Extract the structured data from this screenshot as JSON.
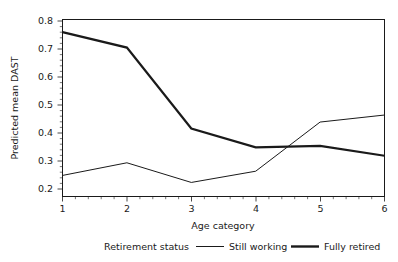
{
  "chart_data": {
    "type": "line",
    "title": "",
    "xlabel": "Age category",
    "ylabel": "Predicted mean DAST",
    "x": [
      1,
      2,
      3,
      4,
      5,
      6
    ],
    "categories": [
      "1",
      "2",
      "3",
      "4",
      "5",
      "6"
    ],
    "xtick_labels": [
      "1",
      "2",
      "3",
      "4",
      "5",
      "6"
    ],
    "ytick_labels": [
      "0.2",
      "0.3",
      "0.4",
      "0.5",
      "0.6",
      "0.7",
      "0.8"
    ],
    "ytick_values": [
      0.2,
      0.3,
      0.4,
      0.5,
      0.6,
      0.7,
      0.8
    ],
    "xlim": [
      1,
      6
    ],
    "ylim": [
      0.185,
      0.815
    ],
    "grid": false,
    "legend_position": "bottom",
    "legend_title": "Retirement status",
    "series": [
      {
        "name": "Still working",
        "values": [
          0.26,
          0.305,
          0.235,
          0.275,
          0.45,
          0.475
        ],
        "line_width": 1.0,
        "color": "#1a1a1a"
      },
      {
        "name": "Fully retired",
        "values": [
          0.77,
          0.715,
          0.427,
          0.36,
          0.365,
          0.33
        ],
        "line_width": 2.2,
        "color": "#1a1a1a"
      }
    ]
  },
  "legend": {
    "title": "Retirement status",
    "entries": [
      {
        "label": "Still working",
        "swatch": "thin-line-swatch"
      },
      {
        "label": "Fully retired",
        "swatch": "thick-line-swatch"
      }
    ]
  },
  "axes": {
    "x_title": "Age category",
    "y_title": "Predicted mean DAST",
    "x_ticks": [
      "1",
      "2",
      "3",
      "4",
      "5",
      "6"
    ],
    "y_ticks": [
      "0.2",
      "0.3",
      "0.4",
      "0.5",
      "0.6",
      "0.7",
      "0.8"
    ]
  },
  "colors": {
    "foreground": "#1a1a1a",
    "background": "#ffffff"
  }
}
